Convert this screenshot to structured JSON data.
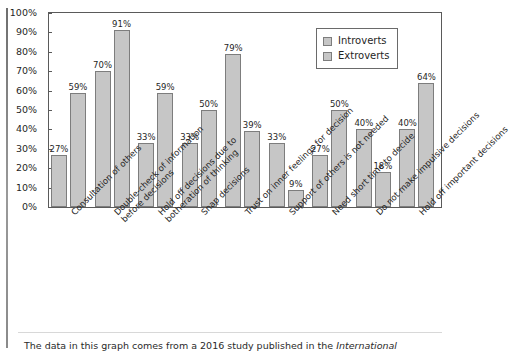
{
  "chart_data": {
    "type": "bar",
    "title": "",
    "xlabel": "",
    "ylabel": "",
    "ylim": [
      0,
      100
    ],
    "ytick_labels": [
      "100%",
      "90%",
      "80%",
      "70%",
      "60%",
      "50%",
      "40%",
      "30%",
      "20%",
      "10%",
      "0%"
    ],
    "yticks": [
      100,
      90,
      80,
      70,
      60,
      50,
      40,
      30,
      20,
      10,
      0
    ],
    "grid": false,
    "legend_position": "top-right",
    "categories": [
      "Consultation of others",
      "Double-check of information before decisions",
      "Hold off decisions due to botheration of thinking",
      "Snap decisions",
      "Trust on inner feelings for decision",
      "Support of others is not needed",
      "Need short time to decide",
      "Do not make impulsive decisions",
      "Hold off important decisions"
    ],
    "category_lines": [
      [
        "Consultation of others",
        ""
      ],
      [
        "Double-check of information",
        "before decisions"
      ],
      [
        "Hold off decisions due to",
        "botheration of thinking"
      ],
      [
        "Snap decisions",
        ""
      ],
      [
        "Trust on inner feelings for decision",
        ""
      ],
      [
        "Support of others is not needed",
        ""
      ],
      [
        "Need short time to decide",
        ""
      ],
      [
        "Do not make impulsive decisions",
        ""
      ],
      [
        "Hold off important decisions",
        ""
      ]
    ],
    "series": [
      {
        "name": "Introverts",
        "values": [
          27,
          70,
          33,
          33,
          79,
          33,
          27,
          40,
          40
        ],
        "labels": [
          "27%",
          "70%",
          "33%",
          "33%",
          "79%",
          "33%",
          "27%",
          "40%",
          "40%"
        ],
        "color": "#c6c6c6"
      },
      {
        "name": "Extroverts",
        "values": [
          59,
          91,
          59,
          50,
          39,
          9,
          50,
          18,
          64
        ],
        "labels": [
          "59%",
          "91%",
          "59%",
          "50%",
          "39%",
          "9%",
          "50%",
          "18%",
          "64%"
        ],
        "color": "#c6c6c6"
      }
    ]
  },
  "legend": {
    "entries": [
      {
        "label": "Introverts"
      },
      {
        "label": "Extroverts"
      }
    ]
  },
  "caption": {
    "text_before": "The data in this graph comes from a 2016 study published in the ",
    "journal": "International",
    "text_after": ""
  },
  "colors": {
    "bar_fill": "#c6c6c6",
    "bar_stroke": "#7d7d7d",
    "axis": "#5a5a5a",
    "text": "#1f1f1f"
  }
}
